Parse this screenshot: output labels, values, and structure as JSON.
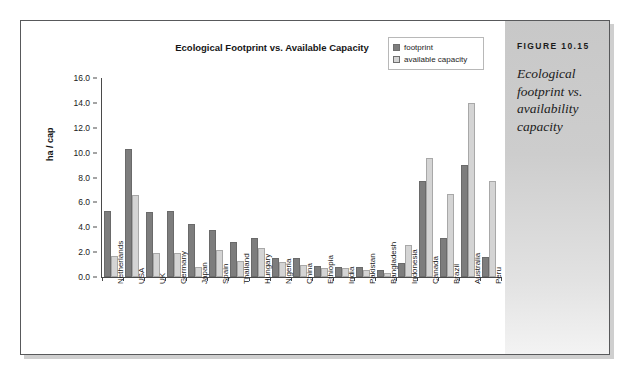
{
  "figure": {
    "number": "FIGURE 10.15",
    "caption": "Ecological footprint vs. availability capacity"
  },
  "legend": {
    "items": [
      {
        "label": "footprint",
        "color": "#7d7d7d"
      },
      {
        "label": "available capacity",
        "color": "#d4d4d4"
      }
    ]
  },
  "chart_data": {
    "type": "bar",
    "title": "Ecological Footprint vs. Available Capacity",
    "xlabel": "",
    "ylabel": "ha / cap",
    "ylim": [
      0.0,
      16.0
    ],
    "ytick_step": 2.0,
    "ytick_labels": [
      "0.0",
      "2.0",
      "4.0",
      "6.0",
      "8.0",
      "10.0",
      "12.0",
      "14.0",
      "16.0"
    ],
    "grid": false,
    "legend_position": "top-right",
    "categories": [
      "Netherlands",
      "USA",
      "UK",
      "Germany",
      "Japan",
      "Spain",
      "Thailand",
      "Hungary",
      "Nigeria",
      "China",
      "Ethiopia",
      "India",
      "Pakistan",
      "Bangladesh",
      "Indonesia",
      "Canada",
      "Brazil",
      "Australia",
      "Peru"
    ],
    "series": [
      {
        "name": "footprint",
        "color": "#7d7d7d",
        "values": [
          5.3,
          10.3,
          5.2,
          5.3,
          4.3,
          3.8,
          2.8,
          3.1,
          1.5,
          1.5,
          0.9,
          0.8,
          0.8,
          0.6,
          1.1,
          7.7,
          3.1,
          9.0,
          1.6
        ]
      },
      {
        "name": "available capacity",
        "color": "#d4d4d4",
        "values": [
          1.7,
          6.6,
          1.9,
          1.9,
          0.8,
          2.2,
          1.3,
          2.3,
          1.2,
          1.0,
          0.7,
          0.7,
          0.6,
          0.3,
          2.6,
          9.6,
          6.7,
          14.0,
          7.7
        ]
      }
    ]
  }
}
